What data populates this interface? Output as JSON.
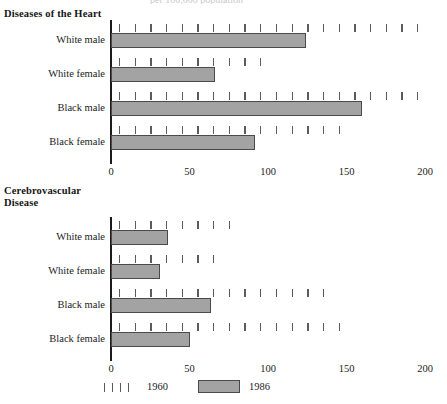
{
  "figure": {
    "clipped_top_text": "per 100,000 population",
    "legend": {
      "series_1960_label": "1960",
      "series_1986_label": "1986"
    }
  },
  "chart_data": [
    {
      "type": "bar",
      "orientation": "horizontal",
      "title": "Diseases of the Heart",
      "categories": [
        "White male",
        "White female",
        "Black male",
        "Black female"
      ],
      "series": [
        {
          "name": "1960",
          "style": "dashed-ticks",
          "values": [
            200,
            100,
            200,
            149
          ]
        },
        {
          "name": "1986",
          "style": "filled-bar",
          "values": [
            124,
            66,
            160,
            92
          ]
        }
      ],
      "xlabel": "",
      "ylabel": "",
      "xlim": [
        0,
        200
      ],
      "xticks": [
        0,
        50,
        100,
        150,
        200
      ],
      "xticklabels": [
        "0",
        "50",
        "100",
        "150",
        "200"
      ],
      "grid": false,
      "legend_position": "bottom"
    },
    {
      "type": "bar",
      "orientation": "horizontal",
      "title": "Cerebrovascular\nDisease",
      "categories": [
        "White male",
        "White female",
        "Black male",
        "Black female"
      ],
      "series": [
        {
          "name": "1960",
          "style": "dashed-ticks",
          "values": [
            77,
            70,
            141,
            145
          ]
        },
        {
          "name": "1986",
          "style": "filled-bar",
          "values": [
            36,
            31,
            64,
            50
          ]
        }
      ],
      "xlabel": "",
      "ylabel": "",
      "xlim": [
        0,
        200
      ],
      "xticks": [
        0,
        50,
        100,
        150,
        200
      ],
      "xticklabels": [
        "0",
        "50",
        "100",
        "150",
        "200"
      ],
      "grid": false,
      "legend_position": "bottom"
    }
  ]
}
